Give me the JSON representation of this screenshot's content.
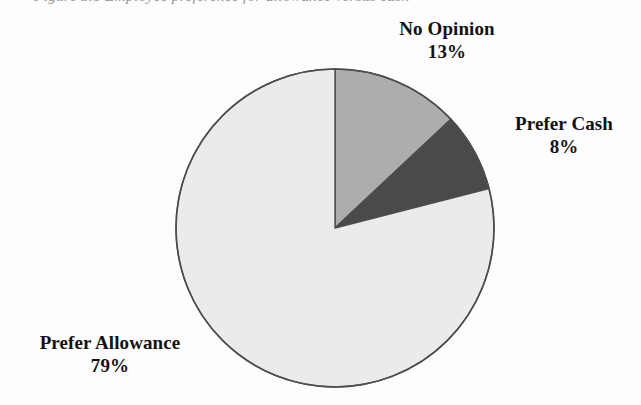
{
  "figure": {
    "clipped_title_fragment": "Figure 3.1  Employee preference for allowance versus cash",
    "background_color": "#fdfdfd"
  },
  "chart_data": {
    "type": "pie",
    "title": "",
    "xlabel": "",
    "ylabel": "",
    "legend_position": "none",
    "grid": false,
    "start_angle_deg": 0,
    "direction": "clockwise",
    "units": "percent",
    "total": 100,
    "categories": [
      "No Opinion",
      "Prefer Cash",
      "Prefer Allowance"
    ],
    "values": [
      13,
      8,
      79
    ],
    "labels": [
      "13%",
      "8%",
      "79%"
    ],
    "colors": [
      "#adadad",
      "#4a4a4a",
      "#ebebeb"
    ],
    "slices": [
      {
        "name": "No Opinion",
        "value": 13,
        "value_label": "13%",
        "color": "#adadad",
        "label_position": "top-right"
      },
      {
        "name": "Prefer Cash",
        "value": 8,
        "value_label": "8%",
        "color": "#4a4a4a",
        "label_position": "right"
      },
      {
        "name": "Prefer Allowance",
        "value": 79,
        "value_label": "79%",
        "color": "#ebebeb",
        "label_position": "bottom-left"
      }
    ],
    "outline_color": "#4d4d4d"
  },
  "labels": {
    "no_opinion": {
      "name": "No Opinion",
      "value": "13%"
    },
    "prefer_cash": {
      "name": "Prefer Cash",
      "value": "8%"
    },
    "prefer_allowance": {
      "name": "Prefer Allowance",
      "value": "79%"
    }
  }
}
